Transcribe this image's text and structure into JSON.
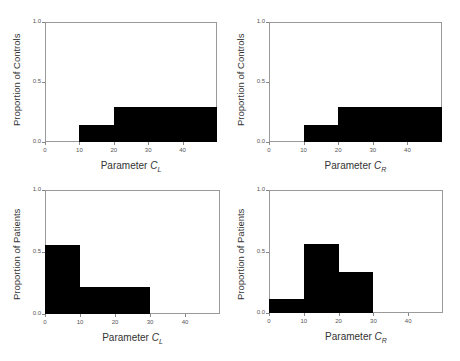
{
  "chart_data": [
    {
      "type": "bar",
      "title": "",
      "xlabel": "Parameter C_L",
      "xlabel_main": "Parameter ",
      "xlabel_var": "C",
      "xlabel_sub": "L",
      "ylabel": "Proportion of Controls",
      "xlim": [
        0,
        50
      ],
      "ylim": [
        0,
        1.0
      ],
      "xticks": [
        "0",
        "10",
        "20",
        "30",
        "40"
      ],
      "yticks": [
        "0.0",
        "0.5",
        "1.0"
      ],
      "bins": [
        [
          10,
          20
        ],
        [
          20,
          50
        ]
      ],
      "values": [
        0.14,
        0.29
      ],
      "grid": false
    },
    {
      "type": "bar",
      "title": "",
      "xlabel": "Parameter C_R",
      "xlabel_main": "Parameter ",
      "xlabel_var": "C",
      "xlabel_sub": "R",
      "ylabel": "Proportion of Controls",
      "xlim": [
        0,
        50
      ],
      "ylim": [
        0,
        1.0
      ],
      "xticks": [
        "0",
        "10",
        "20",
        "30",
        "40"
      ],
      "yticks": [
        "0.0",
        "0.5",
        "1.0"
      ],
      "bins": [
        [
          10,
          20
        ],
        [
          20,
          50
        ]
      ],
      "values": [
        0.14,
        0.29
      ],
      "grid": false
    },
    {
      "type": "bar",
      "title": "",
      "xlabel": "Parameter C_L",
      "xlabel_main": "Parameter ",
      "xlabel_var": "C",
      "xlabel_sub": "L",
      "ylabel": "Proportion of Patients",
      "xlim": [
        0,
        50
      ],
      "ylim": [
        0,
        1.0
      ],
      "xticks": [
        "0",
        "10",
        "20",
        "30",
        "40"
      ],
      "yticks": [
        "0.0",
        "0.5",
        "1.0"
      ],
      "bins": [
        [
          0,
          10
        ],
        [
          10,
          30
        ]
      ],
      "values": [
        0.56,
        0.22
      ],
      "grid": false
    },
    {
      "type": "bar",
      "title": "",
      "xlabel": "Parameter C_R",
      "xlabel_main": "Parameter ",
      "xlabel_var": "C",
      "xlabel_sub": "R",
      "ylabel": "Proportion of Patients",
      "xlim": [
        0,
        50
      ],
      "ylim": [
        0,
        1.0
      ],
      "xticks": [
        "0",
        "10",
        "20",
        "30",
        "40"
      ],
      "yticks": [
        "0.0",
        "0.5",
        "1.0"
      ],
      "bins": [
        [
          0,
          10
        ],
        [
          10,
          20
        ],
        [
          20,
          30
        ]
      ],
      "values": [
        0.11,
        0.56,
        0.33
      ],
      "grid": false
    }
  ],
  "colors": {
    "bar": "#000000",
    "axis": "#9a9a9a",
    "text": "#333333"
  }
}
